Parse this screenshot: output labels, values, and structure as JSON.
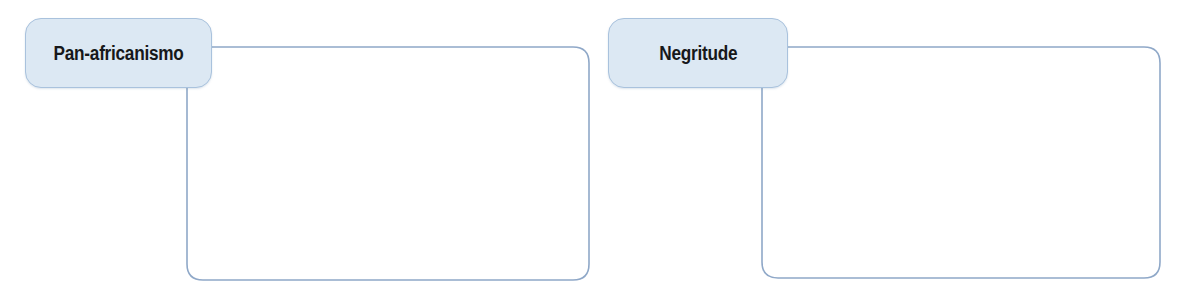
{
  "diagram": {
    "type": "annotation-frames",
    "background_color": "#ffffff",
    "line_color": "#8fa8c8",
    "chip_fill_color": "#dce8f3",
    "chip_border_color": "#a9c2dd",
    "text_color": "#17181a",
    "groups": [
      {
        "id": "pan-africanismo",
        "label": "Pan-africanismo",
        "chip": {
          "x": 25,
          "y": 18,
          "w": 187,
          "h": 70
        },
        "frame": {
          "x": 187,
          "y": 47,
          "w": 402,
          "h": 233
        },
        "body_text": ""
      },
      {
        "id": "negritude",
        "label": "Negritude",
        "chip": {
          "x": 608,
          "y": 18,
          "w": 180,
          "h": 70
        },
        "frame": {
          "x": 762,
          "y": 47,
          "w": 398,
          "h": 231
        },
        "body_text": ""
      }
    ]
  }
}
